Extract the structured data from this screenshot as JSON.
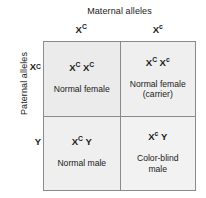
{
  "figure": {
    "type": "punnett-square",
    "topic": "X-linked color blindness inheritance",
    "maternal_axis_title": "Maternal alleles",
    "paternal_axis_title": "Paternal alleles"
  },
  "axes": {
    "maternal_alleles": [
      {
        "symbol": "X",
        "superscript": "C",
        "label": "X^C"
      },
      {
        "symbol": "X",
        "superscript": "c",
        "label": "X^c"
      }
    ],
    "paternal_alleles": [
      {
        "symbol": "X",
        "superscript": "C",
        "label": "X^C"
      },
      {
        "symbol": "Y",
        "superscript": "",
        "label": "Y"
      }
    ]
  },
  "cells": [
    {
      "position": "top-left",
      "allele1": {
        "symbol": "X",
        "superscript": "C"
      },
      "allele2": {
        "symbol": "X",
        "superscript": "C"
      },
      "genotype": "X^C X^C",
      "phenotype": "Normal female"
    },
    {
      "position": "top-right",
      "allele1": {
        "symbol": "X",
        "superscript": "C"
      },
      "allele2": {
        "symbol": "X",
        "superscript": "c"
      },
      "genotype": "X^C X^c",
      "phenotype": "Normal female\n(carrier)"
    },
    {
      "position": "bottom-left",
      "allele1": {
        "symbol": "X",
        "superscript": "C"
      },
      "allele2": {
        "symbol": "Y",
        "superscript": ""
      },
      "genotype": "X^C Y",
      "phenotype": "Normal male"
    },
    {
      "position": "bottom-right",
      "allele1": {
        "symbol": "X",
        "superscript": "c"
      },
      "allele2": {
        "symbol": "Y",
        "superscript": ""
      },
      "genotype": "X^c Y",
      "phenotype": "Color-blind\nmale"
    }
  ],
  "colors": {
    "cell_fill": "#ebebeb",
    "grid_line": "#8a8a8a",
    "text": "#1a1a1a",
    "background": "#ffffff"
  }
}
